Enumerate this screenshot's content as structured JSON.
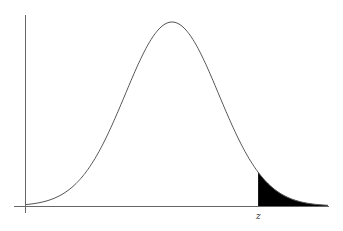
{
  "chart_data": {
    "type": "area",
    "title": "",
    "distribution": "normal",
    "xlabel": "",
    "ylabel": "",
    "annotations": [
      {
        "text": "z",
        "position": "x-axis below shaded region start"
      }
    ],
    "shaded_region": {
      "from": "z",
      "to": "+infinity",
      "color": "#000000"
    },
    "z_in_sd": 1.84,
    "grid": false,
    "legend": null
  },
  "labels": {
    "z": "z"
  },
  "colors": {
    "curve": "#555555",
    "axis": "#666666",
    "shade": "#000000"
  }
}
